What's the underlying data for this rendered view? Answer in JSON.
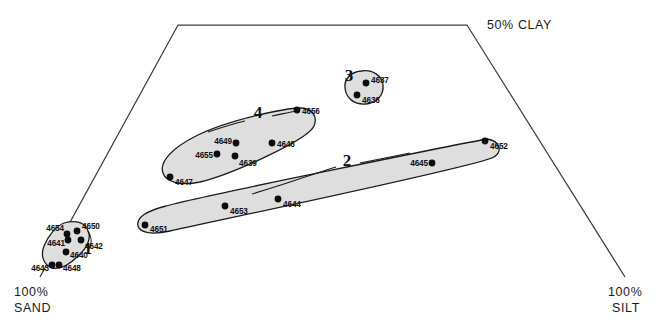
{
  "figure": {
    "type": "ternary-scatter",
    "background": "#ffffff",
    "hull_fill": "#dedede",
    "stroke": "#1a1a1a"
  },
  "corners": {
    "bottom_left": {
      "label_line1": "100%",
      "label_line2": "SAND"
    },
    "bottom_right": {
      "label_line1": "100%",
      "label_line2": "SILT"
    },
    "top_right": {
      "label": "50% CLAY"
    }
  },
  "chart_data": {
    "type": "scatter",
    "title": "",
    "xlabel": "",
    "ylabel": "",
    "axis_corner_labels": [
      "100% SAND",
      "100% SILT",
      "50% CLAY"
    ],
    "frame": {
      "points": [
        [
          40,
          277
        ],
        [
          178,
          25
        ],
        [
          467,
          25
        ],
        [
          625,
          277
        ]
      ],
      "closed": false
    },
    "grid": false,
    "legend": "none",
    "clusters": [
      {
        "id": "1",
        "number": "1",
        "number_pos": [
          88,
          254
        ],
        "hull": "M 64 223 C 78 219 86 224 88 231 C 92 239 86 249 78 256 C 70 264 60 270 52 268 C 44 265 40 256 44 246 C 48 236 56 226 64 223 Z",
        "leader": "M 88 231 C 92 237 92 244 89 249",
        "points": [
          {
            "id": "4654",
            "x": 67,
            "y": 234,
            "label_side": "left",
            "label_dx": -3,
            "label_dy": -6
          },
          {
            "id": "4650",
            "x": 77,
            "y": 231,
            "label_side": "right",
            "label_dx": 5,
            "label_dy": -5
          },
          {
            "id": "4641",
            "x": 68,
            "y": 240,
            "label_side": "left",
            "label_dx": -3,
            "label_dy": 3
          },
          {
            "id": "4642",
            "x": 81,
            "y": 240,
            "label_side": "right",
            "label_dx": 4,
            "label_dy": 6
          },
          {
            "id": "4640",
            "x": 66,
            "y": 252,
            "label_side": "right",
            "label_dx": 4,
            "label_dy": 3
          },
          {
            "id": "4648",
            "x": 59,
            "y": 265,
            "label_side": "right",
            "label_dx": 4,
            "label_dy": 3
          },
          {
            "id": "4643",
            "x": 52,
            "y": 265,
            "label_side": "left",
            "label_dx": -3,
            "label_dy": 3
          }
        ]
      },
      {
        "id": "2",
        "number": "2",
        "number_pos": [
          347,
          166
        ],
        "hull": "M 487 139 C 500 141 503 151 494 157 C 480 166 200 224 170 231 C 152 235 140 233 138 226 C 136 218 146 211 166 206 C 200 196 470 142 487 139 Z",
        "leader": "M 360 163 C 380 159 395 156 410 153 M 336 167 C 320 172 305 177 290 182 C 278 186 265 190 252 194",
        "points": [
          {
            "id": "4651",
            "x": 145,
            "y": 225,
            "label_side": "right",
            "label_dx": 5,
            "label_dy": 4
          },
          {
            "id": "4653",
            "x": 225,
            "y": 206,
            "label_side": "right",
            "label_dx": 5,
            "label_dy": 5
          },
          {
            "id": "4644",
            "x": 278,
            "y": 199,
            "label_side": "right",
            "label_dx": 5,
            "label_dy": 5
          },
          {
            "id": "4645",
            "x": 432,
            "y": 163,
            "label_side": "left",
            "label_dx": -4,
            "label_dy": 0
          },
          {
            "id": "4652",
            "x": 485,
            "y": 141,
            "label_side": "right",
            "label_dx": 5,
            "label_dy": 5
          }
        ]
      },
      {
        "id": "3",
        "number": "3",
        "number_pos": [
          349,
          81
        ],
        "hull": "M 361 71 C 373 69 382 76 383 85 C 384 95 377 103 366 104 C 354 105 346 98 345 88 C 344 79 351 72 361 71 Z",
        "leader": "",
        "points": [
          {
            "id": "4637",
            "x": 366,
            "y": 83,
            "label_side": "right",
            "label_dx": 5,
            "label_dy": -3
          },
          {
            "id": "4636",
            "x": 357,
            "y": 95,
            "label_side": "right",
            "label_dx": 5,
            "label_dy": 5
          }
        ]
      },
      {
        "id": "4",
        "number": "4",
        "number_pos": [
          258,
          118
        ],
        "hull": "M 300 108 C 312 108 318 116 314 126 C 308 140 230 175 200 182 C 180 186 166 182 163 173 C 159 162 172 148 196 136 C 230 119 288 108 300 108 Z",
        "leader": "M 272 116 C 282 114 290 112 297 111 M 245 121 C 232 124 220 128 208 132",
        "points": [
          {
            "id": "4656",
            "x": 297,
            "y": 110,
            "label_side": "right",
            "label_dx": 5,
            "label_dy": 1
          },
          {
            "id": "4649",
            "x": 236,
            "y": 143,
            "label_side": "left",
            "label_dx": -4,
            "label_dy": -2
          },
          {
            "id": "4646",
            "x": 272,
            "y": 143,
            "label_side": "right",
            "label_dx": 5,
            "label_dy": 1
          },
          {
            "id": "4655",
            "x": 217,
            "y": 154,
            "label_side": "left",
            "label_dx": -4,
            "label_dy": 1
          },
          {
            "id": "4639",
            "x": 235,
            "y": 156,
            "label_side": "right",
            "label_dx": 4,
            "label_dy": 7
          },
          {
            "id": "4647",
            "x": 170,
            "y": 177,
            "label_side": "right",
            "label_dx": 5,
            "label_dy": 5
          }
        ]
      }
    ]
  }
}
